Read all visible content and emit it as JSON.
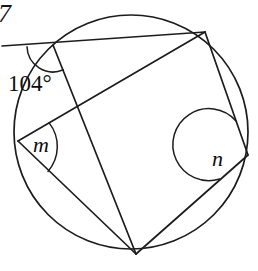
{
  "figure": {
    "corner_mark": "7",
    "labels": {
      "exterior_angle": "104°",
      "angle_m": "m",
      "angle_n": "n"
    },
    "colors": {
      "ink": "#1c1c1c",
      "text": "#0d0d0d",
      "background": "#ffffff"
    },
    "geometry": {
      "circle": {
        "cx": 131,
        "cy": 132,
        "r": 117
      },
      "points": {
        "A": {
          "x": 53,
          "y": 45,
          "role": "top-left-vertex-104"
        },
        "B": {
          "x": 205,
          "y": 32,
          "role": "top-right-vertex"
        },
        "C": {
          "x": 248,
          "y": 155,
          "role": "right-vertex-n"
        },
        "D": {
          "x": 136,
          "y": 254,
          "role": "bottom-vertex"
        },
        "E": {
          "x": 18,
          "y": 141,
          "role": "left-vertex-m"
        },
        "T": {
          "x": 2,
          "y": 46,
          "role": "secant-left-end"
        }
      },
      "segments": [
        {
          "name": "secant-T-B",
          "from": "T",
          "to": "B"
        },
        {
          "name": "chord-A-D",
          "from": "A",
          "to": "D"
        },
        {
          "name": "chord-E-B",
          "from": "E",
          "to": "B"
        },
        {
          "name": "chord-E-D",
          "from": "E",
          "to": "D"
        },
        {
          "name": "chord-D-C",
          "from": "D",
          "to": "C"
        },
        {
          "name": "chord-B-C",
          "from": "B",
          "to": "C"
        }
      ],
      "angle_arcs": [
        {
          "name": "arc-104",
          "vertex": "A",
          "radius": 26
        },
        {
          "name": "arc-m",
          "vertex": "E",
          "radius": 38
        },
        {
          "name": "arc-n",
          "vertex": "C",
          "radius": 36
        }
      ]
    },
    "label_positions": {
      "exterior_angle": {
        "x": 8,
        "y": 91
      },
      "angle_m": {
        "x": 33,
        "y": 152
      },
      "angle_n": {
        "x": 212,
        "y": 166
      },
      "corner_mark": {
        "x": -2,
        "y": 22
      }
    }
  }
}
